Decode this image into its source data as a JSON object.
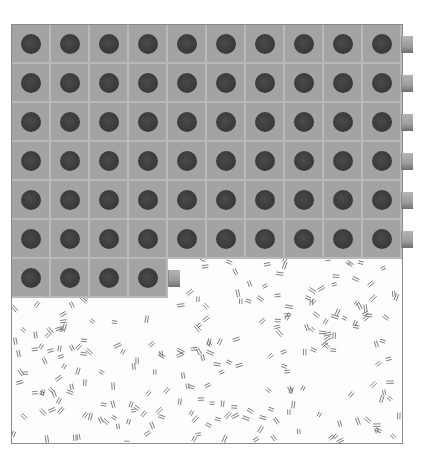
{
  "scene": {
    "background_color": "#ffffff",
    "frame_border_color": "#8a8a8a",
    "cell_color": "#a3a3a3",
    "cell_gap_color": "#b9b9b9",
    "dot_color": "#3c3c3c",
    "grid": {
      "columns": 10,
      "full_rows": 6,
      "last_row_cells": 4,
      "cell_size_px": 39,
      "origin": [
        11,
        24
      ]
    },
    "side_tabs": {
      "right_edge_rows": [
        0,
        1,
        2,
        3,
        4,
        5
      ],
      "bottom_partial_row_tab": true
    },
    "texture": "scattered short double-line hatch marks on white"
  }
}
